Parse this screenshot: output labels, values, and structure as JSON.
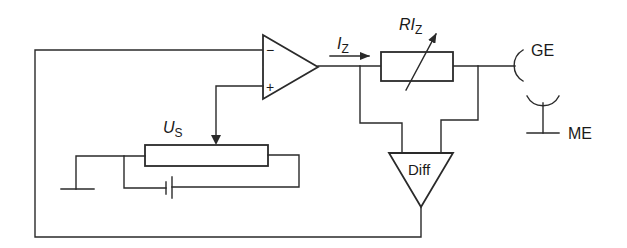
{
  "diagram": {
    "type": "circuit-schematic",
    "colors": {
      "line": "#2a2a2a",
      "text": "#1a1a1a",
      "background": "#ffffff"
    },
    "op_amp": {
      "minus_symbol": "−",
      "plus_symbol": "+"
    },
    "current_label": {
      "main": "I",
      "subscript": "Z"
    },
    "resistor_label": {
      "main": "RI",
      "subscript": "Z"
    },
    "source_voltage_label": {
      "main": "U",
      "subscript": "S"
    },
    "electrode_ge": {
      "label": "GE"
    },
    "electrode_me": {
      "label": "ME"
    },
    "diff_amp": {
      "label": "Diff"
    }
  }
}
